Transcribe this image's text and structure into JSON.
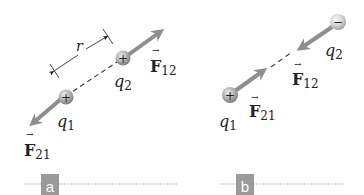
{
  "panels": [
    {
      "id": "a",
      "tag": "a",
      "charges": [
        {
          "name": "q1",
          "label_base": "q",
          "label_sub": "1",
          "sign": "+"
        },
        {
          "name": "q2",
          "label_base": "q",
          "label_sub": "2",
          "sign": "+"
        }
      ],
      "forces": [
        {
          "name": "F12",
          "label_base": "F",
          "label_sub": "12",
          "direction": "away from q1 (repulsive)"
        },
        {
          "name": "F21",
          "label_base": "F",
          "label_sub": "21",
          "direction": "away from q2 (repulsive)"
        }
      ],
      "distance_label": "r"
    },
    {
      "id": "b",
      "tag": "b",
      "charges": [
        {
          "name": "q1",
          "label_base": "q",
          "label_sub": "1",
          "sign": "+"
        },
        {
          "name": "q2",
          "label_base": "q",
          "label_sub": "2",
          "sign": "−"
        }
      ],
      "forces": [
        {
          "name": "F12",
          "label_base": "F",
          "label_sub": "12",
          "direction": "toward q1 (attractive)"
        },
        {
          "name": "F21",
          "label_base": "F",
          "label_sub": "21",
          "direction": "toward q2 (attractive)"
        }
      ]
    }
  ],
  "colors": {
    "arrow": "#8e8e8e",
    "charge_fill": "#a9a9a9",
    "tag_bg": "#9a9a9a",
    "rule": "#b5b5b5",
    "text": "#222222"
  }
}
